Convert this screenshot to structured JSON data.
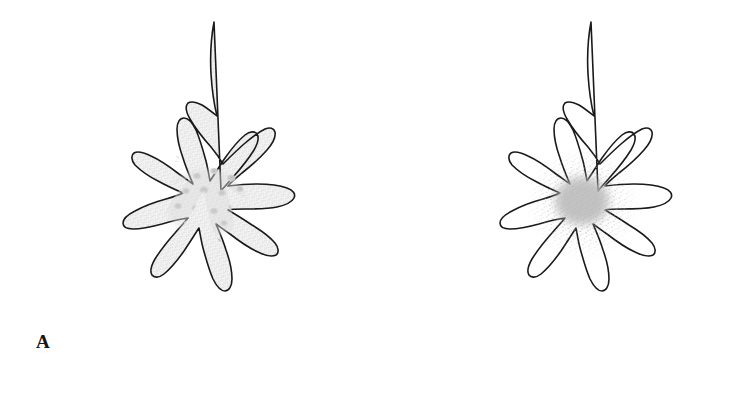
{
  "figure": {
    "background_color": "#ffffff",
    "width": 754,
    "height": 398
  },
  "panels": [
    {
      "id": "A",
      "label": "A",
      "description": "Stellate cell, cytoplasm fully stipple-shaded with granular inclusions",
      "outline_color": "#1a1a1a",
      "outline_width": 1.6,
      "cytoplasm_fill": "#ebebeb",
      "cytoplasm_shaded": true,
      "nucleus_fill": "#cfcfcf",
      "nucleus_visible": false,
      "granules_visible": true,
      "granule_color": "#b9b9b9",
      "granule_count": 17
    },
    {
      "id": "B",
      "label": "B",
      "description": "Same stellate cell outline, unshaded cytoplasm with diffuse gray central nucleus",
      "outline_color": "#1a1a1a",
      "outline_width": 1.6,
      "cytoplasm_fill": "#ffffff",
      "cytoplasm_shaded": false,
      "nucleus_fill": "#b5b5b5",
      "nucleus_visible": true,
      "granules_visible": false,
      "granule_color": "#b9b9b9",
      "granule_count": 0
    }
  ],
  "shape": {
    "outline_path": "M 184 18 C 182 30 181 44 181 58 C 181 72 182 86 184 98 C 179 92 173 86 167 81 C 161 76 155 72 150 70 C 147 69 145 70 145 73 C 145 77 148 82 152 88 C 158 96 166 105 173 113 C 178 119 182 125 185 130 C 181 129 176 127 171 126 C 164 124 157 123 151 123 C 145 123 141 125 140 128 C 139 132 142 136 147 140 C 153 145 161 149 168 152 C 174 155 179 158 182 161 C 175 161 167 162 159 164 C 149 167 141 171 136 176 C 132 180 131 185 134 188 C 137 191 143 192 150 191 C 158 190 167 187 175 184 C 181 181 186 179 190 178 L 190 178 C 184 184 178 191 173 199 C 167 208 163 217 162 225 C 161 231 163 236 167 237 C 171 238 176 235 181 229 C 187 222 192 213 196 205 C 199 199 202 194 204 190 C 205 197 206 205 208 213 C 210 223 213 232 217 238 C 220 243 224 245 228 243 C 232 241 234 236 234 229 C 234 221 232 212 230 203 C 228 196 227 190 226 185 C 231 189 237 194 244 198 C 252 203 260 207 267 208 C 272 209 277 207 278 203 C 279 199 276 194 270 189 C 264 184 256 179 248 175 C 242 172 237 169 233 167 C 240 166 248 164 256 161 C 265 158 273 154 278 149 C 282 145 283 140 280 137 C 277 134 272 133 265 134 C 258 135 250 138 242 141 C 236 144 231 146 227 148 C 232 142 238 135 243 127 C 249 118 253 109 254 102 C 255 96 253 92 249 91 C 245 90 240 93 235 99 C 230 106 225 114 221 122 C 218 128 215 133 213 137 C 212 130 211 122 210 114 C 208 104 205 95 201 89 C 198 84 194 82 190 84 C 186 86 184 91 184 98 Z",
    "nucleus_center": [
      196,
      194
    ],
    "nucleus_radius": 34
  },
  "icons": {
    "cell_outline": "cell-outline-icon",
    "nucleus": "nucleus-icon",
    "granule": "granule-icon"
  }
}
